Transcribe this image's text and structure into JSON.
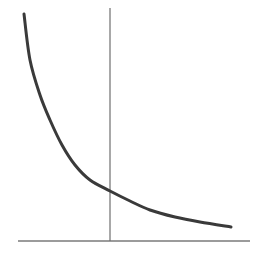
{
  "chart_data": {
    "type": "line",
    "title": "",
    "xlabel": "",
    "ylabel": "",
    "legend": [],
    "grid": false,
    "series": [
      {
        "name": "curve",
        "points": [
          [
            24,
            14
          ],
          [
            30,
            60
          ],
          [
            40,
            95
          ],
          [
            50,
            120
          ],
          [
            62,
            145
          ],
          [
            75,
            165
          ],
          [
            90,
            180
          ],
          [
            110,
            191
          ],
          [
            130,
            201
          ],
          [
            150,
            210
          ],
          [
            175,
            217
          ],
          [
            200,
            222
          ],
          [
            231,
            227
          ]
        ]
      }
    ],
    "vertical_line": {
      "x": 110,
      "y_top": 8,
      "y_bottom": 241
    },
    "x_axis": {
      "y": 241,
      "x_start": 18,
      "x_end": 250
    },
    "colors": {
      "curve": "#3a3a3a",
      "axis": "#7a7a7a",
      "vline": "#6e6e6e"
    }
  }
}
